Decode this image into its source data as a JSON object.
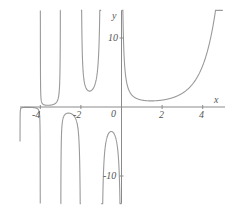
{
  "chart_data": {
    "type": "line",
    "title": "",
    "function": "Gamma(x)",
    "xlabel": "x",
    "ylabel": "y",
    "xlim": [
      -5,
      5
    ],
    "ylim": [
      -14,
      14
    ],
    "grid": false,
    "legend": null,
    "x_ticks": [
      {
        "value": -4,
        "label": "-4"
      },
      {
        "value": -2,
        "label": "-2"
      },
      {
        "value": 2,
        "label": "2"
      },
      {
        "value": 4,
        "label": "4"
      }
    ],
    "y_ticks": [
      {
        "value": 10,
        "label": "10"
      },
      {
        "value": -10,
        "label": "-10"
      }
    ],
    "origin_label": "0",
    "asymptotes_x": [
      0,
      -1,
      -2,
      -3,
      -4,
      -5
    ],
    "series": [
      {
        "name": "Gamma(x)",
        "color": "#9a9a9a",
        "x": [
          -4.5,
          -3.5,
          -2.5,
          -1.5,
          -0.5,
          0.1,
          0.2,
          0.5,
          1,
          1.46,
          2,
          3,
          4,
          4.5,
          4.6
        ],
        "values": [
          -0.06,
          0.27,
          -0.945,
          2.363,
          -3.545,
          9.514,
          4.591,
          1.772,
          1,
          0.886,
          1,
          2,
          6,
          11.632,
          13.381
        ]
      }
    ]
  },
  "axes": {
    "x_label": "x",
    "y_label": "y",
    "origin": "0",
    "tick_x_neg4": "-4",
    "tick_x_neg2": "-2",
    "tick_x_2": "2",
    "tick_x_4": "4",
    "tick_y_10": "10",
    "tick_y_neg10": "-10"
  },
  "colors": {
    "curve": "#9a9a9a",
    "axis": "#8a8a8a",
    "text": "#555555",
    "background": "#ffffff"
  }
}
